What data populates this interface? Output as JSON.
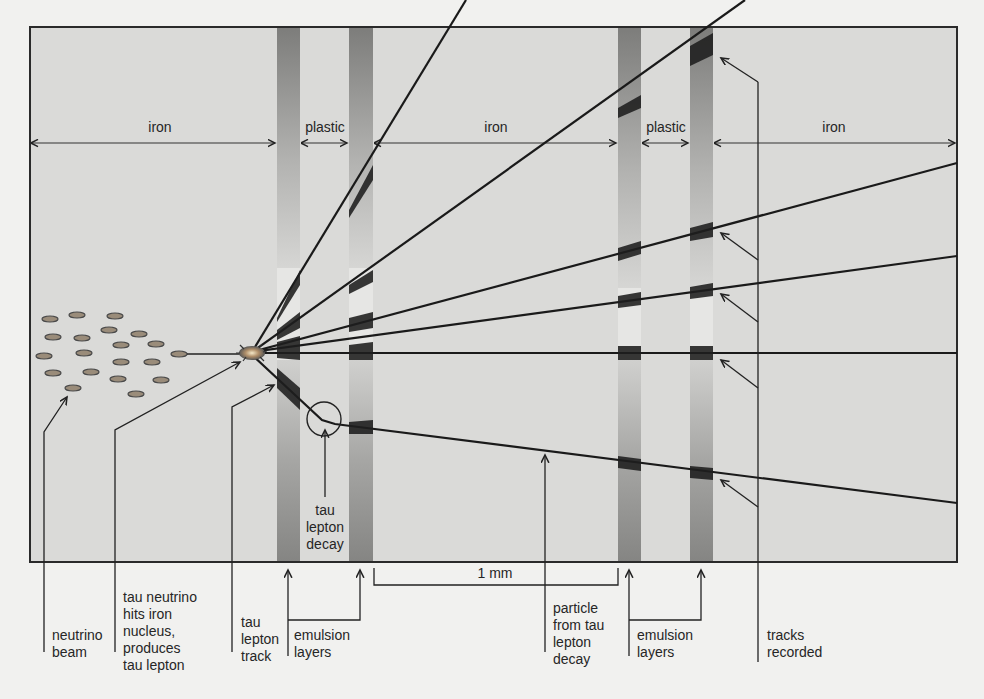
{
  "diagram": {
    "colors": {
      "background": "#f1f1ef",
      "chamber": "#dadad8",
      "emulsion": "#8c8c8a",
      "track": "#1a1a1a",
      "frame": "#2a2a2a"
    },
    "region_labels": [
      {
        "id": "iron-1",
        "text": "iron"
      },
      {
        "id": "plastic-1",
        "text": "plastic"
      },
      {
        "id": "iron-2",
        "text": "iron"
      },
      {
        "id": "plastic-2",
        "text": "plastic"
      },
      {
        "id": "iron-3",
        "text": "iron"
      }
    ],
    "scale_label": "1 mm",
    "inner_label": "tau\nlepton\ndecay",
    "callouts": [
      {
        "id": "neutrino-beam",
        "text": "neutrino\nbeam"
      },
      {
        "id": "tau-neutrino-hits",
        "text": "tau neutrino\nhits iron\nnucleus,\nproduces\ntau lepton"
      },
      {
        "id": "tau-lepton-track",
        "text": "tau\nlepton\ntrack"
      },
      {
        "id": "emulsion-layers-1",
        "text": "emulsion\nlayers"
      },
      {
        "id": "particle-from-decay",
        "text": "particle\nfrom tau\nlepton\ndecay"
      },
      {
        "id": "emulsion-layers-2",
        "text": "emulsion\nlayers"
      },
      {
        "id": "tracks-recorded",
        "text": "tracks\nrecorded"
      }
    ]
  }
}
